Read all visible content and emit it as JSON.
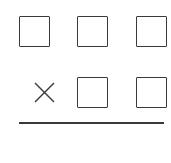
{
  "diagram": {
    "type": "multiplication-blank-template",
    "rows": [
      {
        "operator": "",
        "boxes": 3
      },
      {
        "operator": "×",
        "boxes": 2
      }
    ],
    "operator_icon": "multiply-icon",
    "stroke_color": "#3a3a3a",
    "background": "#ffffff"
  }
}
